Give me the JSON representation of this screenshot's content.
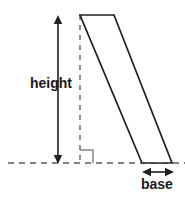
{
  "figure": {
    "kind": "parallelogram-area-diagram",
    "labels": {
      "height": "height",
      "base": "base"
    },
    "colors": {
      "shape_stroke": "#231f20",
      "guide_stroke": "#58595b",
      "right_angle_stroke": "#808285",
      "text": "#1a1a1a",
      "background": "#ffffff",
      "shape_fill": "#ffffff"
    },
    "geometry": {
      "parallelogram": {
        "top_left": [
          80,
          15
        ],
        "top_right": [
          114,
          15
        ],
        "bottom_right": [
          172,
          163
        ],
        "bottom_left": [
          142,
          163
        ]
      },
      "baseline_dashed": {
        "y": 163,
        "x_start": 8,
        "x_end": 185
      },
      "height_dashed_vertical": {
        "x": 80,
        "y_start": 15,
        "y_end": 163
      },
      "height_arrow": {
        "x": 58,
        "y_top": 16,
        "y_bottom": 163,
        "double_headed": true
      },
      "base_arrow": {
        "y": 172,
        "x_left": 143,
        "x_right": 173,
        "double_headed": true
      },
      "right_angle_marker": {
        "x": 80,
        "y": 163,
        "size": 13
      }
    }
  }
}
